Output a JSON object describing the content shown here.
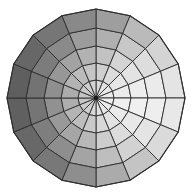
{
  "chart_data": {
    "type": "heatmap",
    "subtype": "polar-sector-heatmap",
    "title": "",
    "subtitle": "",
    "xlabel": "",
    "ylabel": "",
    "grid": false,
    "legend": false,
    "legend_position": "none",
    "background_color": "#ffffff",
    "stroke_color": "#2d2d2d",
    "center_dot_color": "#1c1c1c",
    "geometry": {
      "center_x": 96,
      "center_y": 98,
      "outer_radius": 89,
      "n_rings": 5,
      "n_sectors": 16,
      "ring_radii": [
        18,
        35,
        52,
        70,
        89
      ],
      "angle_offset_deg": -90,
      "sector_width_deg": 22.5,
      "center_dot_radius": 2.2
    },
    "axis_ranges": {
      "theta": [
        0,
        360
      ],
      "r": [
        0,
        89
      ]
    },
    "ring_labels": [
      "r1",
      "r2",
      "r3",
      "r4",
      "r5"
    ],
    "sector_labels": [
      "s1",
      "s2",
      "s3",
      "s4",
      "s5",
      "s6",
      "s7",
      "s8",
      "s9",
      "s10",
      "s11",
      "s12",
      "s13",
      "s14",
      "s15",
      "s16"
    ],
    "value_scale": {
      "min": 0,
      "max": 100,
      "colormap": "grayscale",
      "color_min": "#5f5f5f",
      "color_max": "#f0f0f0"
    },
    "cells": [
      {
        "ring": 1,
        "colors": [
          "#d9d9d9",
          "#e2e2e2",
          "#e9e9e9",
          "#ececec",
          "#eeeeee",
          "#ebebeb",
          "#e6e6e6",
          "#e0e0e0",
          "#d6d6d6",
          "#cfcfcf",
          "#cacaca",
          "#c6c6c6",
          "#c4c4c4",
          "#c8c8c8",
          "#cdcdcd",
          "#d3d3d3"
        ],
        "values": [
          72,
          76,
          80,
          82,
          83,
          81,
          78,
          75,
          70,
          66,
          63,
          61,
          60,
          62,
          65,
          69
        ]
      },
      {
        "ring": 2,
        "colors": [
          "#cfcfcf",
          "#dcdcdc",
          "#e6e6e6",
          "#ececec",
          "#efefef",
          "#eaeaea",
          "#e2e2e2",
          "#d8d8d8",
          "#c9c9c9",
          "#bdbdbd",
          "#b4b4b4",
          "#aeaeae",
          "#acacac",
          "#b3b3b3",
          "#bbbbbb",
          "#c5c5c5"
        ],
        "values": [
          66,
          73,
          78,
          82,
          84,
          81,
          76,
          71,
          64,
          57,
          52,
          49,
          48,
          52,
          56,
          62
        ]
      },
      {
        "ring": 3,
        "colors": [
          "#c2c2c2",
          "#d4d4d4",
          "#e3e3e3",
          "#ededed",
          "#f0f0f0",
          "#e8e8e8",
          "#dcdcdc",
          "#cdcdcd",
          "#b8b8b8",
          "#a6a6a6",
          "#999999",
          "#919191",
          "#8f8f8f",
          "#979797",
          "#a3a3a3",
          "#b2b2b2"
        ],
        "values": [
          60,
          68,
          76,
          83,
          85,
          80,
          73,
          65,
          55,
          46,
          40,
          36,
          35,
          39,
          44,
          51
        ]
      },
      {
        "ring": 4,
        "colors": [
          "#b0b0b0",
          "#c8c8c8",
          "#dddddd",
          "#ebebeb",
          "#eeeeee",
          "#e4e4e4",
          "#d2d2d2",
          "#bebebe",
          "#a4a4a4",
          "#8e8e8e",
          "#7e7e7e",
          "#757575",
          "#737373",
          "#7c7c7c",
          "#8a8a8a",
          "#9c9c9c"
        ],
        "values": [
          52,
          62,
          72,
          81,
          84,
          78,
          68,
          58,
          46,
          36,
          29,
          25,
          24,
          28,
          33,
          41
        ]
      },
      {
        "ring": 5,
        "colors": [
          "#9e9e9e",
          "#bababa",
          "#d4d4d4",
          "#e4e4e4",
          "#e8e8e8",
          "#dadada",
          "#c4c4c4",
          "#ababab",
          "#8e8e8e",
          "#787878",
          "#686868",
          "#606060",
          "#5f5f5f",
          "#676767",
          "#767676",
          "#898989"
        ],
        "values": [
          44,
          55,
          67,
          77,
          80,
          72,
          61,
          49,
          37,
          27,
          20,
          16,
          15,
          19,
          24,
          32
        ]
      }
    ],
    "annotations": []
  },
  "figure": {
    "alt_text": "Polar sector heatmap with 5 concentric rings and 16 angular sectors filled in grayscale",
    "width": 193,
    "height": 196
  }
}
